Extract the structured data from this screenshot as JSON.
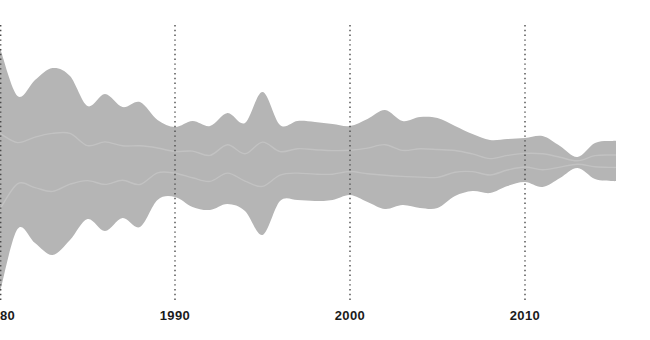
{
  "page": {
    "background_color": "#ffffff"
  },
  "chart_data": {
    "type": "area",
    "variant": "streamgraph",
    "title": "",
    "xlabel": "",
    "ylabel": "",
    "grid": "vertical-dotted",
    "legend": "none",
    "x_axis": {
      "range": [
        1980,
        2015.2
      ],
      "ticks": [
        {
          "year": 1980,
          "label": "1980"
        },
        {
          "year": 1990,
          "label": "1990"
        },
        {
          "year": 2000,
          "label": "2000"
        },
        {
          "year": 2010,
          "label": "2010"
        }
      ]
    },
    "x": [
      1980,
      1981,
      1982,
      1983,
      1984,
      1985,
      1986,
      1987,
      1988,
      1989,
      1990,
      1991,
      1992,
      1993,
      1994,
      1995,
      1996,
      1997,
      1998,
      1999,
      2000,
      2001,
      2002,
      2003,
      2004,
      2005,
      2006,
      2007,
      2008,
      2009,
      2010,
      2011,
      2012,
      2013,
      2014,
      2015,
      2015.2
    ],
    "series": [
      {
        "name": "stream",
        "top_y": [
          48,
          96,
          80,
          68,
          76,
          106,
          94,
          107,
          102,
          120,
          127,
          121,
          126,
          113,
          123,
          92,
          125,
          121,
          122,
          124,
          126,
          119,
          110,
          121,
          117,
          118,
          126,
          134,
          140,
          139,
          138,
          136,
          146,
          157,
          143,
          141,
          141
        ],
        "bottom_y": [
          292,
          229,
          243,
          255,
          240,
          219,
          231,
          218,
          227,
          200,
          197,
          207,
          210,
          204,
          211,
          235,
          201,
          200,
          201,
          200,
          195,
          202,
          209,
          205,
          208,
          208,
          196,
          191,
          193,
          186,
          182,
          187,
          178,
          168,
          179,
          181,
          181
        ]
      }
    ],
    "layout": {
      "px_per_year": 17.5,
      "x_origin_px": 0,
      "grid_top_px": 25,
      "grid_bottom_px": 303,
      "end_cap": "flat-vertical"
    },
    "colors": {
      "stream": "#b5b5b5",
      "inner_ribbon_highlight": "#ffffff",
      "gridline": "#4a4a4a",
      "tick_label": "#1b1b1b",
      "background": "#ffffff"
    }
  }
}
